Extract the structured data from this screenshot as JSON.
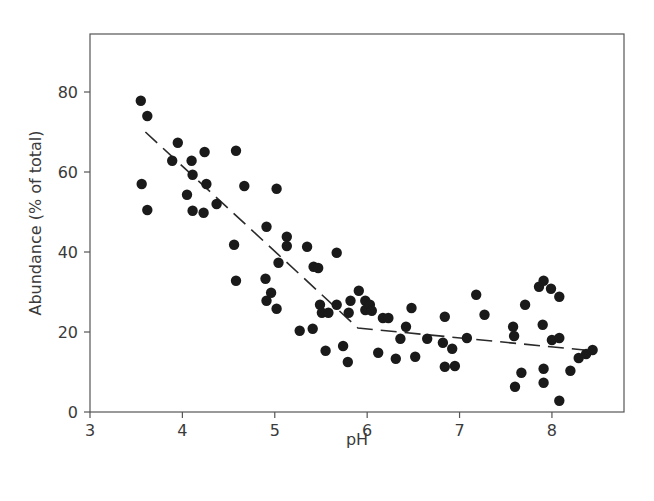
{
  "chart_data": {
    "type": "scatter",
    "title": "",
    "xlabel": "pH",
    "ylabel": "Abundance (% of total)",
    "xlim": [
      3,
      8.78
    ],
    "ylim": [
      0,
      94.5
    ],
    "xticks": [
      3,
      4,
      5,
      6,
      7,
      8
    ],
    "yticks": [
      0,
      20,
      40,
      60,
      80
    ],
    "xtick_labels": [
      "3",
      "4",
      "5",
      "6",
      "7",
      "8"
    ],
    "ytick_labels": [
      "0",
      "20",
      "40",
      "60",
      "80"
    ],
    "grid": false,
    "legend": null,
    "series": [
      {
        "name": "observations",
        "kind": "scatter",
        "color": "#1a1a1a",
        "points": [
          [
            3.55,
            77.8
          ],
          [
            3.62,
            74.0
          ],
          [
            3.56,
            57.0
          ],
          [
            3.62,
            50.5
          ],
          [
            3.89,
            62.8
          ],
          [
            3.95,
            67.3
          ],
          [
            4.05,
            54.3
          ],
          [
            4.1,
            62.8
          ],
          [
            4.11,
            59.3
          ],
          [
            4.11,
            50.3
          ],
          [
            4.23,
            49.8
          ],
          [
            4.24,
            65.0
          ],
          [
            4.26,
            57.0
          ],
          [
            4.37,
            52.0
          ],
          [
            4.56,
            41.8
          ],
          [
            4.58,
            65.3
          ],
          [
            4.58,
            32.8
          ],
          [
            4.67,
            56.5
          ],
          [
            4.9,
            33.3
          ],
          [
            4.91,
            46.3
          ],
          [
            4.91,
            27.8
          ],
          [
            4.96,
            29.8
          ],
          [
            5.02,
            55.8
          ],
          [
            5.02,
            25.8
          ],
          [
            5.04,
            37.3
          ],
          [
            5.13,
            43.8
          ],
          [
            5.13,
            41.5
          ],
          [
            5.27,
            20.3
          ],
          [
            5.35,
            41.3
          ],
          [
            5.41,
            20.8
          ],
          [
            5.42,
            36.3
          ],
          [
            5.47,
            36.0
          ],
          [
            5.49,
            26.8
          ],
          [
            5.51,
            24.8
          ],
          [
            5.55,
            15.3
          ],
          [
            5.58,
            24.8
          ],
          [
            5.67,
            39.8
          ],
          [
            5.67,
            26.8
          ],
          [
            5.74,
            16.5
          ],
          [
            5.79,
            12.5
          ],
          [
            5.8,
            24.8
          ],
          [
            5.82,
            27.8
          ],
          [
            5.91,
            30.3
          ],
          [
            5.98,
            27.8
          ],
          [
            5.98,
            25.5
          ],
          [
            6.03,
            26.8
          ],
          [
            6.05,
            25.3
          ],
          [
            6.12,
            14.8
          ],
          [
            6.17,
            23.5
          ],
          [
            6.23,
            23.5
          ],
          [
            6.31,
            13.3
          ],
          [
            6.36,
            18.3
          ],
          [
            6.42,
            21.3
          ],
          [
            6.48,
            26.0
          ],
          [
            6.52,
            13.8
          ],
          [
            6.65,
            18.3
          ],
          [
            6.82,
            17.3
          ],
          [
            6.84,
            23.8
          ],
          [
            6.84,
            11.3
          ],
          [
            6.92,
            15.8
          ],
          [
            6.95,
            11.5
          ],
          [
            7.08,
            18.5
          ],
          [
            7.18,
            29.3
          ],
          [
            7.27,
            24.3
          ],
          [
            7.58,
            21.3
          ],
          [
            7.59,
            19.0
          ],
          [
            7.6,
            6.3
          ],
          [
            7.67,
            9.8
          ],
          [
            7.71,
            26.8
          ],
          [
            7.86,
            31.3
          ],
          [
            7.9,
            21.8
          ],
          [
            7.91,
            32.8
          ],
          [
            7.91,
            10.8
          ],
          [
            7.91,
            7.3
          ],
          [
            7.99,
            30.8
          ],
          [
            8.0,
            18.0
          ],
          [
            8.08,
            28.8
          ],
          [
            8.08,
            18.5
          ],
          [
            8.08,
            2.8
          ],
          [
            8.2,
            10.3
          ],
          [
            8.29,
            13.5
          ],
          [
            8.37,
            14.5
          ],
          [
            8.44,
            15.5
          ]
        ]
      },
      {
        "name": "piecewise fit",
        "kind": "line",
        "style": "dashed",
        "color": "#2a2a2a",
        "points": [
          [
            3.6,
            70.0
          ],
          [
            5.9,
            21.0
          ],
          [
            8.35,
            15.5
          ]
        ]
      }
    ]
  }
}
